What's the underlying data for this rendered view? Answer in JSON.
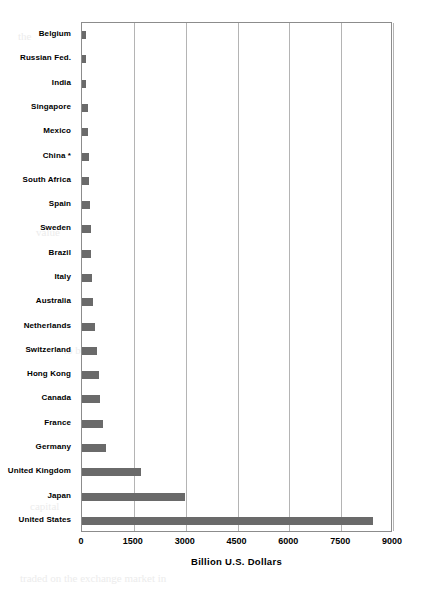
{
  "chart_data": {
    "type": "bar",
    "orientation": "horizontal",
    "title": "",
    "subtitle": "",
    "xlabel": "Billion  U.S. Dollars",
    "ylabel": "",
    "xlim": [
      0,
      9000
    ],
    "xticks": [
      0,
      1500,
      3000,
      4500,
      6000,
      7500,
      9000
    ],
    "xtick_labels": [
      "0",
      "1500",
      "3000",
      "4500",
      "6000",
      "7500",
      "9000"
    ],
    "grid": true,
    "legend": null,
    "bar_color": "#6a6a6a",
    "axis_color": "#8c8c8c",
    "gridline_color": "#b4b4b4",
    "categories": [
      "Belgium",
      "Russian Fed.",
      "India",
      "Singapore",
      "Mexico",
      "China *",
      "South Africa",
      "Spain",
      "Sweden",
      "Brazil",
      "Italy",
      "Australia",
      "Netherlands",
      "Switzerland",
      "Hong Kong",
      "Canada",
      "France",
      "Germany",
      "United Kingdom",
      "Japan",
      "United States"
    ],
    "values": [
      105,
      120,
      130,
      160,
      175,
      200,
      215,
      230,
      250,
      270,
      290,
      325,
      380,
      420,
      480,
      530,
      610,
      700,
      1710,
      2980,
      8420
    ]
  },
  "ghost_marks": [
    {
      "text": "the",
      "x": 18,
      "y": 30
    },
    {
      "text": "of",
      "x": 150,
      "y": 52
    },
    {
      "text": "in the",
      "x": 248,
      "y": 74
    },
    {
      "text": "and",
      "x": 330,
      "y": 116
    },
    {
      "text": "some",
      "x": 120,
      "y": 160
    },
    {
      "text": "market",
      "x": 276,
      "y": 182
    },
    {
      "text": "value",
      "x": 36,
      "y": 226
    },
    {
      "text": "that",
      "x": 200,
      "y": 268
    },
    {
      "text": "as",
      "x": 356,
      "y": 300
    },
    {
      "text": "to be",
      "x": 64,
      "y": 344
    },
    {
      "text": "more",
      "x": 290,
      "y": 388
    },
    {
      "text": "shares",
      "x": 140,
      "y": 430
    },
    {
      "text": "were",
      "x": 330,
      "y": 466
    },
    {
      "text": "capital",
      "x": 30,
      "y": 500
    },
    {
      "text": "traded on the exchange market in",
      "x": 20,
      "y": 572
    }
  ]
}
